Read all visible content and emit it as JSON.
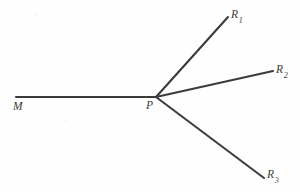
{
  "figure": {
    "kind": "ray-diagram",
    "background_color": "#fefefe",
    "stroke_color": "#3b3b3b",
    "stroke_width": 2.1,
    "width": 300,
    "height": 192,
    "vertex": {
      "id": "P",
      "label": "P",
      "x": 156,
      "y": 97
    },
    "labels": {
      "M": "M",
      "P": "P",
      "R1_base": "R",
      "R1_sub": "1",
      "R2_base": "R",
      "R2_sub": "2",
      "R3_base": "R",
      "R3_sub": "3"
    },
    "segments": [
      {
        "name": "incident-ray-MP",
        "from_label": "M",
        "to_label": "P",
        "x1": 16,
        "y1": 97,
        "x2": 156,
        "y2": 97,
        "angle_deg": 0
      },
      {
        "name": "ray-P-R1",
        "from_label": "P",
        "to_label": "R1",
        "x1": 156,
        "y1": 97,
        "x2": 228,
        "y2": 17,
        "angle_deg": 48
      },
      {
        "name": "ray-P-R2",
        "from_label": "P",
        "to_label": "R2",
        "x1": 156,
        "y1": 97,
        "x2": 273,
        "y2": 71,
        "angle_deg": 12.5
      },
      {
        "name": "ray-P-R3",
        "from_label": "P",
        "to_label": "R3",
        "x1": 156,
        "y1": 97,
        "x2": 264,
        "y2": 178,
        "angle_deg": -36.8
      }
    ]
  }
}
